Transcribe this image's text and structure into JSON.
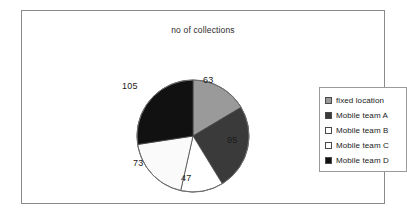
{
  "frame": {
    "border_color": "#8a8a8a",
    "background": "#ffffff"
  },
  "chart_data": {
    "type": "pie",
    "title": "no of collections",
    "subtitle": "",
    "xlabel": "",
    "ylabel": "",
    "grid": false,
    "legend_position": "right",
    "total": 383,
    "start_angle_deg": 0,
    "direction": "clockwise",
    "categories": [
      "fixed location",
      "Mobile team A",
      "Mobile team B",
      "Mobile team C",
      "Mobile team D"
    ],
    "values": [
      63,
      95,
      47,
      73,
      105
    ],
    "data_labels": [
      "63",
      "95",
      "47",
      "73",
      "105"
    ],
    "colors": [
      "#9a9a9a",
      "#3a3a3a",
      "#ffffff",
      "#fafafa",
      "#111111"
    ],
    "slices": [
      {
        "label": "fixed location",
        "value": 63,
        "data_label": "63",
        "color": "#9a9a9a",
        "angle_deg": 59.2,
        "start_deg": 0.0,
        "end_deg": 59.2
      },
      {
        "label": "Mobile team A",
        "value": 95,
        "data_label": "95",
        "color": "#3a3a3a",
        "angle_deg": 89.3,
        "start_deg": 59.2,
        "end_deg": 148.5
      },
      {
        "label": "Mobile team B",
        "value": 47,
        "data_label": "47",
        "color": "#ffffff",
        "angle_deg": 44.2,
        "start_deg": 148.5,
        "end_deg": 192.7
      },
      {
        "label": "Mobile team C",
        "value": 73,
        "data_label": "73",
        "color": "#fafafa",
        "angle_deg": 68.6,
        "start_deg": 192.7,
        "end_deg": 261.3
      },
      {
        "label": "Mobile team D",
        "value": 105,
        "data_label": "105",
        "color": "#111111",
        "angle_deg": 98.7,
        "start_deg": 261.3,
        "end_deg": 360.0
      }
    ]
  },
  "legend": {
    "items": [
      {
        "label": "fixed location",
        "swatch_color": "#9a9a9a",
        "swatch_icon": "legend-swatch-icon"
      },
      {
        "label": "Mobile team A",
        "swatch_color": "#3a3a3a",
        "swatch_icon": "legend-swatch-icon"
      },
      {
        "label": "Mobile team B",
        "swatch_color": "#ffffff",
        "swatch_icon": "legend-swatch-icon"
      },
      {
        "label": "Mobile team C",
        "swatch_color": "#ffffff",
        "swatch_icon": "legend-swatch-icon"
      },
      {
        "label": "Mobile team D",
        "swatch_color": "#111111",
        "swatch_icon": "legend-swatch-icon"
      }
    ]
  }
}
